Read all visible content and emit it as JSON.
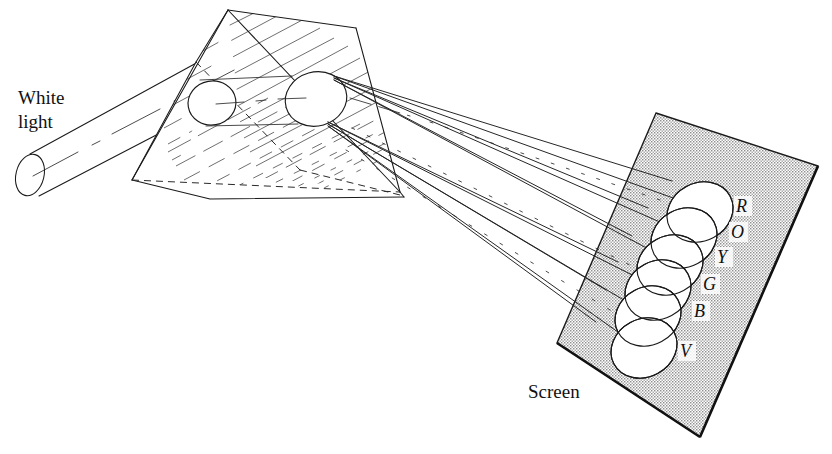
{
  "figure": {
    "background_color": "#ffffff",
    "ink_color": "#1a1a1a",
    "screen_fill_color": "#d9d9d9"
  },
  "labels": {
    "white_light_line1": "White",
    "white_light_line2": "light",
    "screen": "Screen"
  },
  "spectrum": {
    "letters": [
      {
        "id": "R",
        "label": "R",
        "name": "red",
        "x": 742,
        "y": 212
      },
      {
        "id": "O",
        "label": "O",
        "name": "orange",
        "x": 737,
        "y": 238
      },
      {
        "id": "Y",
        "label": "Y",
        "name": "yellow",
        "x": 723,
        "y": 263
      },
      {
        "id": "G",
        "label": "G",
        "name": "green",
        "x": 709,
        "y": 290
      },
      {
        "id": "B",
        "label": "B",
        "name": "blue",
        "x": 700,
        "y": 317
      },
      {
        "id": "V",
        "label": "V",
        "name": "violet",
        "x": 686,
        "y": 357
      }
    ],
    "spots": [
      {
        "id": "spot-red",
        "cx": 700,
        "cy": 212,
        "rx": 34,
        "ry": 29,
        "rotation": -28
      },
      {
        "id": "spot-orange",
        "cx": 684,
        "cy": 238,
        "rx": 34,
        "ry": 29,
        "rotation": -28
      },
      {
        "id": "spot-yellow",
        "cx": 670,
        "cy": 265,
        "rx": 34,
        "ry": 29,
        "rotation": -28
      },
      {
        "id": "spot-green",
        "cx": 658,
        "cy": 290,
        "rx": 34,
        "ry": 29,
        "rotation": -28
      },
      {
        "id": "spot-blue",
        "cx": 648,
        "cy": 316,
        "rx": 34,
        "ry": 29,
        "rotation": -28
      },
      {
        "id": "spot-violet",
        "cx": 644,
        "cy": 348,
        "rx": 34,
        "ry": 29,
        "rotation": -28
      }
    ]
  },
  "screen_panel": {
    "corners": [
      {
        "x": 656,
        "y": 113
      },
      {
        "x": 818,
        "y": 166
      },
      {
        "x": 700,
        "y": 437
      },
      {
        "x": 557,
        "y": 343
      }
    ]
  },
  "prism": {
    "apex": {
      "x": 228,
      "y": 10
    },
    "front_face_id": "prism-front-face",
    "description": "Triangular glass prism drawn in perspective with hatched shading and dashed hidden edges"
  },
  "incident_beam": {
    "description": "Cylindrical beam of white light entering the prism from the lower left",
    "entry_ellipse": {
      "cx": 30,
      "cy": 175,
      "rx": 14,
      "ry": 21,
      "rotation": 14
    }
  },
  "ray_fan": {
    "upper_origin": {
      "x": 334,
      "y": 76
    },
    "lower_origin": {
      "x": 328,
      "y": 122
    },
    "ray_count": 6
  }
}
